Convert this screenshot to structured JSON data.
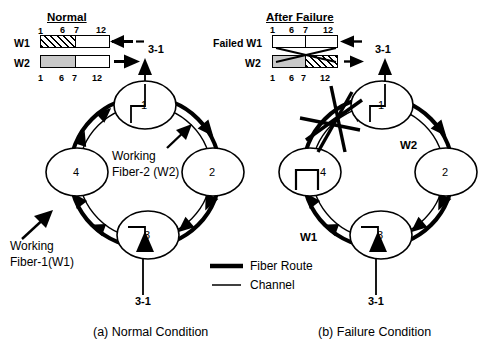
{
  "figure": {
    "caption_a": "(a) Normal Condition",
    "caption_b": "(b) Failure Condition"
  },
  "legend": {
    "fiber_route": "Fiber Route",
    "channel": "Channel"
  },
  "panel_a": {
    "title": "Normal",
    "scale_top": [
      "1",
      "6",
      "7",
      "12"
    ],
    "scale_bottom": [
      "1",
      "6",
      "7",
      "12"
    ],
    "bars": [
      {
        "label": "W1",
        "direction": "left",
        "segments": [
          {
            "range": "1-6",
            "fill": "hatch"
          },
          {
            "range": "7-12",
            "fill": "white"
          }
        ]
      },
      {
        "label": "W2",
        "direction": "right",
        "segments": [
          {
            "range": "1-6",
            "fill": "gray"
          },
          {
            "range": "7-12",
            "fill": "white"
          }
        ]
      }
    ],
    "ring": {
      "nodes": [
        "1",
        "2",
        "3",
        "4"
      ],
      "add_drop_top": "3-1",
      "add_drop_bottom": "3-1",
      "annot_inner": "Working\nFiber-2 (W2)",
      "annot_inner_line1": "Working",
      "annot_inner_line2": "Fiber-2 (W2)",
      "annot_outer_line1": "Working",
      "annot_outer_line2": "Fiber-1(W1)"
    }
  },
  "panel_b": {
    "title": "After Failure",
    "scale_top": [
      "1",
      "6",
      "7",
      "12"
    ],
    "scale_bottom": [
      "1",
      "6",
      "7",
      "12"
    ],
    "bars": [
      {
        "label": "Failed W1",
        "direction": "left",
        "segments": [
          {
            "range": "1-6",
            "fill": "white"
          },
          {
            "range": "7-12",
            "fill": "white"
          }
        ]
      },
      {
        "label": "W2",
        "direction": "right",
        "segments": [
          {
            "range": "1-6",
            "fill": "gray"
          },
          {
            "range": "7-12",
            "fill": "hatch"
          }
        ]
      }
    ],
    "ring": {
      "nodes": [
        "1",
        "2",
        "3",
        "4"
      ],
      "add_drop_top": "3-1",
      "add_drop_bottom": "3-1",
      "label_w1": "W1",
      "label_w2": "W2",
      "failure_marker": "cut-starburst"
    }
  },
  "colors": {
    "ink": "#000000",
    "gray_fill": "#c9c9c9",
    "paper": "#ffffff"
  }
}
